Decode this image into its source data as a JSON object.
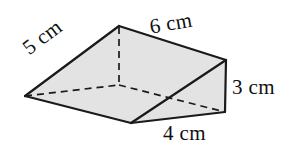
{
  "figure": {
    "name": "triangular-prism-wedge",
    "shape_type": "triangular prism",
    "fill_color": "#e3e3e3",
    "stroke_color": "#1a1a1a",
    "background_color": "#ffffff",
    "labels": {
      "slant_edge": "5 cm",
      "top_edge": "6 cm",
      "height_edge": "3 cm",
      "base_edge": "4 cm"
    },
    "geometry": {
      "apex_top_left": [
        119,
        26
      ],
      "apex_top_right": [
        226,
        60
      ],
      "left_bottom": [
        25,
        96
      ],
      "hidden_back_bottom": [
        119,
        85
      ],
      "front_bottom": [
        131,
        123
      ],
      "right_bottom": [
        225,
        112
      ]
    }
  }
}
